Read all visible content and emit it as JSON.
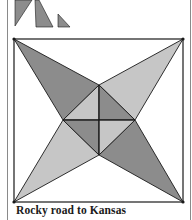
{
  "caption": "Rocky road to Kansas",
  "colors": {
    "dark": "#8c8c8c",
    "light": "#c6c6c6",
    "white": "#ffffff",
    "line": "#1a1a1a",
    "frame": "#8a8a8a"
  },
  "templates": [
    {
      "name": "template-triangle-1",
      "points": "15,0 32,0 15,26",
      "fill": "dark"
    },
    {
      "name": "template-triangle-2",
      "points": "35,0 39,0 53,27 36,27",
      "fill": "dark"
    },
    {
      "name": "template-triangle-3",
      "points": "58,14 58,27 70,27",
      "fill": "dark"
    }
  ],
  "block": {
    "square": {
      "x": 14,
      "y": 39,
      "w": 169,
      "h": 163
    },
    "points": {
      "tl": [
        14,
        39
      ],
      "tr": [
        183,
        39
      ],
      "bl": [
        14,
        202
      ],
      "br": [
        183,
        202
      ],
      "top": [
        99,
        85
      ],
      "left": [
        63,
        120
      ],
      "right": [
        135,
        120
      ],
      "bottom": [
        99,
        155
      ],
      "center": [
        99,
        120
      ]
    },
    "pieces": [
      {
        "name": "outer-top-left-kite",
        "poly": [
          "tl",
          "top",
          "left"
        ],
        "fill": "dark"
      },
      {
        "name": "outer-top-right-kite",
        "poly": [
          "tr",
          "right",
          "top"
        ],
        "fill": "light"
      },
      {
        "name": "outer-bottom-left-kite",
        "poly": [
          "bl",
          "left",
          "bottom"
        ],
        "fill": "light"
      },
      {
        "name": "outer-bottom-right-kite",
        "poly": [
          "br",
          "bottom",
          "right"
        ],
        "fill": "dark"
      },
      {
        "name": "center-top-left-triangle",
        "poly": [
          "top",
          "left",
          "center"
        ],
        "fill": "light"
      },
      {
        "name": "center-top-right-triangle",
        "poly": [
          "top",
          "right",
          "center"
        ],
        "fill": "dark"
      },
      {
        "name": "center-bottom-left-triangle",
        "poly": [
          "left",
          "bottom",
          "center"
        ],
        "fill": "dark"
      },
      {
        "name": "center-bottom-right-triangle",
        "poly": [
          "right",
          "bottom",
          "center"
        ],
        "fill": "light"
      }
    ]
  }
}
